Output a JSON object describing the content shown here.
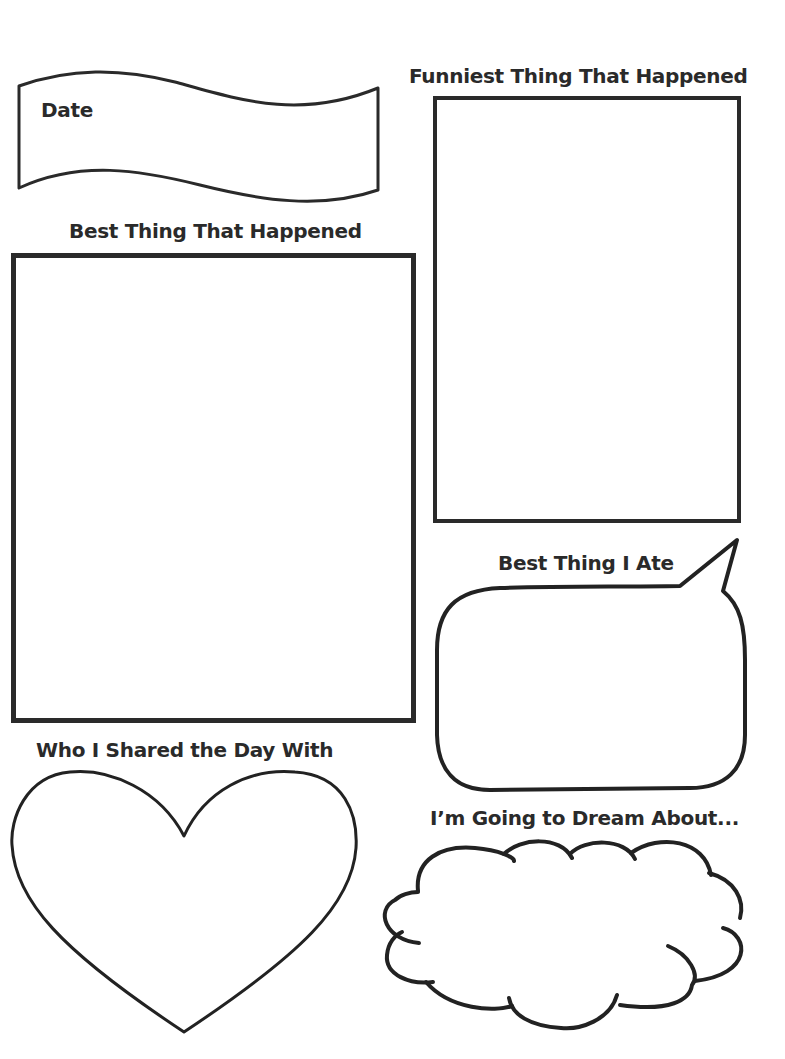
{
  "worksheet": {
    "date": {
      "label": "Date"
    },
    "best_thing": {
      "label": "Best Thing That Happened"
    },
    "funniest_thing": {
      "label": "Funniest Thing That Happened"
    },
    "best_thing_ate": {
      "label": "Best Thing I Ate"
    },
    "shared_day_with": {
      "label": "Who I Shared the Day With"
    },
    "dream_about": {
      "label": "I’m Going to Dream About..."
    }
  },
  "colors": {
    "ink": "#2a2a2a",
    "paper": "#ffffff"
  }
}
